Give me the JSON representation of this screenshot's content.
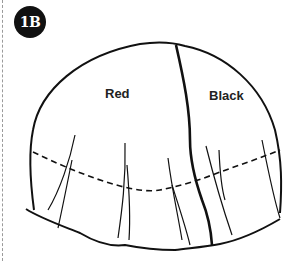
{
  "figure": {
    "step_badge": "1B",
    "regions": [
      {
        "label": "Red"
      },
      {
        "label": "Black"
      }
    ]
  },
  "colors": {
    "ink": "#111111",
    "margin": "#9a9a9a",
    "background": "#ffffff"
  }
}
